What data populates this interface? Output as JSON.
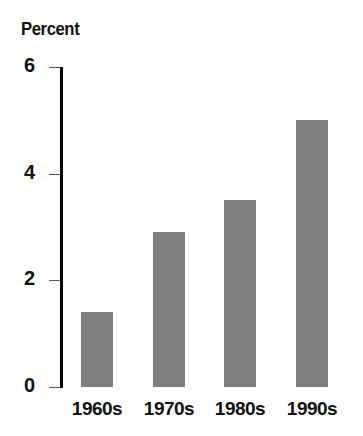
{
  "chart_data": {
    "type": "bar",
    "title": "",
    "ylabel": "Percent",
    "xlabel": "",
    "categories": [
      "1960s",
      "1970s",
      "1980s",
      "1990s"
    ],
    "values": [
      1.4,
      2.9,
      3.5,
      5.0
    ],
    "ylim": [
      0,
      6
    ],
    "yticks": [
      0,
      2,
      4,
      6
    ],
    "ytick_labels": [
      "0",
      "2",
      "4",
      "6"
    ],
    "grid": false,
    "legend": null,
    "colors": {
      "bar": "#7f7f7f",
      "axis": "#000000"
    }
  }
}
